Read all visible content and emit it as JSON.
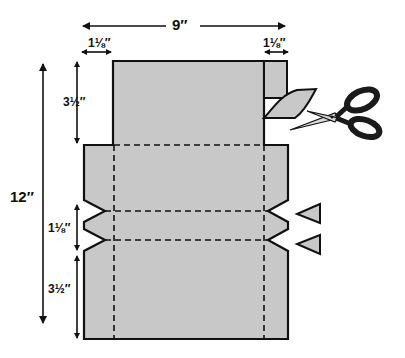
{
  "diagram": {
    "type": "paper-cutting-template",
    "dimensions": {
      "total_width": "9″",
      "total_height": "12″",
      "left_margin_width": "1⅛″",
      "right_margin_width": "1⅛″",
      "top_section_height": "3½″",
      "middle_notch_height": "1⅛″",
      "bottom_section_height": "3½″"
    },
    "colors": {
      "paper_fill": "#c8c8c8",
      "outline": "#111111",
      "scissors_handle": "#1a1a1a",
      "background": "#ffffff"
    },
    "icons": [
      "scissors-icon",
      "triangle-notch-icon",
      "triangle-notch-icon"
    ]
  }
}
